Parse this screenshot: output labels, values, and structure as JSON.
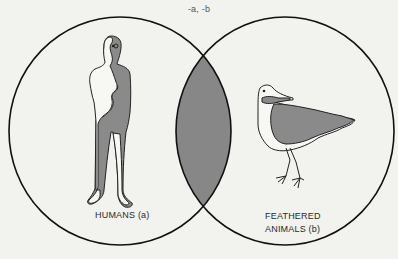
{
  "diagram": {
    "type": "venn",
    "title": "-a, -b",
    "sets": [
      {
        "id": "a",
        "label": "HUMANS (a)",
        "illustration": "human-figure"
      },
      {
        "id": "b",
        "label_line1": "FEATHERED",
        "label_line2": "ANIMALS (b)",
        "illustration": "bird"
      }
    ],
    "intersection": {
      "shaded": true,
      "meaning": "empty (a and b)"
    },
    "colors": {
      "background": "#f2f2ef",
      "stroke": "#111111",
      "shade": "#878787"
    }
  }
}
